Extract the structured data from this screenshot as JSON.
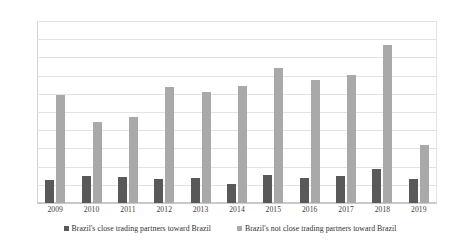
{
  "chart_data": {
    "type": "bar",
    "title": "",
    "subtitle": "",
    "xlabel": "",
    "ylabel": "",
    "categories": [
      "2009",
      "2010",
      "2011",
      "2012",
      "2013",
      "2014",
      "2015",
      "2016",
      "2017",
      "2018",
      "2019"
    ],
    "series": [
      {
        "name": "Brazil's close trading partners toward Brazil",
        "color": "#595959",
        "values": [
          64,
          74,
          71,
          67,
          68,
          52,
          78,
          68,
          73,
          93,
          66
        ]
      },
      {
        "name": "Brazil's not close trading partners toward Brazil",
        "color": "#a9a9a9",
        "values": [
          297,
          222,
          237,
          318,
          305,
          322,
          371,
          337,
          352,
          435,
          160
        ]
      }
    ],
    "ylim": [
      0,
      500
    ],
    "yticks": [
      "0",
      "50",
      "100",
      "150",
      "200",
      "250",
      "300",
      "350",
      "400",
      "450",
      "500"
    ],
    "ytick_values": [
      0,
      50,
      100,
      150,
      200,
      250,
      300,
      350,
      400,
      450,
      500
    ],
    "grid": true,
    "legend_position": "bottom"
  },
  "legend": {
    "entries": [
      {
        "label": "Brazil's close trading partners toward Brazil"
      },
      {
        "label": "Brazil's not close trading partners toward Brazil"
      }
    ]
  }
}
